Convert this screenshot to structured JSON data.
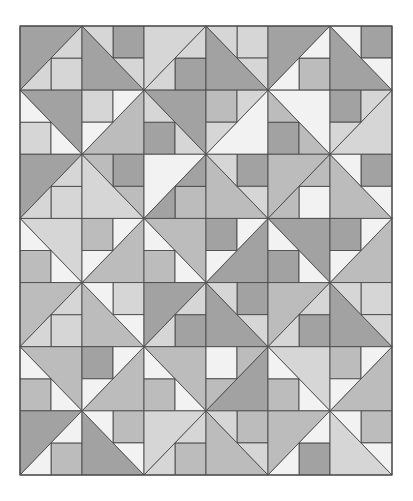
{
  "canvas": {
    "width": 413,
    "height": 501,
    "background": "#ffffff"
  },
  "grid": {
    "left": 20,
    "top": 26,
    "width": 372,
    "height": 449,
    "cols": 6,
    "rows": 7,
    "line_color": "#4a4a4a"
  },
  "palette": {
    "D": "#a2a2a2",
    "M": "#bcbcbc",
    "L": "#d6d6d6",
    "W": "#f2f2f2"
  },
  "block_types": {
    "A": "diagonal bottom-left to top-right, large triangle top-left, square bottom-right",
    "B": "diagonal top-left to bottom-right, large triangle bottom-left, square top-right",
    "C": "diagonal top-left to bottom-right, large triangle top-right, square bottom-left",
    "D": "diagonal bottom-left to top-right, large triangle bottom-right, square top-left"
  },
  "blocks": [
    [
      {
        "t": "A",
        "big": "D",
        "sq": "L",
        "tri": "L"
      },
      {
        "t": "B",
        "big": "D",
        "sq": "D",
        "tri": "L"
      },
      {
        "t": "A",
        "big": "L",
        "sq": "D",
        "tri": "L"
      },
      {
        "t": "B",
        "big": "D",
        "sq": "L",
        "tri": "L"
      },
      {
        "t": "A",
        "big": "D",
        "sq": "M",
        "tri": "W"
      },
      {
        "t": "B",
        "big": "D",
        "sq": "D",
        "tri": "W"
      }
    ],
    [
      {
        "t": "C",
        "big": "D",
        "sq": "L",
        "tri": "W"
      },
      {
        "t": "D",
        "big": "M",
        "sq": "L",
        "tri": "W"
      },
      {
        "t": "C",
        "big": "D",
        "sq": "D",
        "tri": "L"
      },
      {
        "t": "D",
        "big": "W",
        "sq": "M",
        "tri": "L"
      },
      {
        "t": "C",
        "big": "W",
        "sq": "D",
        "tri": "M"
      },
      {
        "t": "D",
        "big": "L",
        "sq": "D",
        "tri": "L"
      }
    ],
    [
      {
        "t": "A",
        "big": "D",
        "sq": "L",
        "tri": "L"
      },
      {
        "t": "B",
        "big": "L",
        "sq": "D",
        "tri": "M"
      },
      {
        "t": "A",
        "big": "W",
        "sq": "M",
        "tri": "D"
      },
      {
        "t": "B",
        "big": "M",
        "sq": "D",
        "tri": "L"
      },
      {
        "t": "A",
        "big": "M",
        "sq": "W",
        "tri": "M"
      },
      {
        "t": "B",
        "big": "M",
        "sq": "D",
        "tri": "W"
      }
    ],
    [
      {
        "t": "C",
        "big": "L",
        "sq": "M",
        "tri": "W"
      },
      {
        "t": "D",
        "big": "M",
        "sq": "M",
        "tri": "W"
      },
      {
        "t": "C",
        "big": "M",
        "sq": "M",
        "tri": "W"
      },
      {
        "t": "D",
        "big": "D",
        "sq": "D",
        "tri": "W"
      },
      {
        "t": "C",
        "big": "D",
        "sq": "D",
        "tri": "W"
      },
      {
        "t": "D",
        "big": "M",
        "sq": "D",
        "tri": "W"
      }
    ],
    [
      {
        "t": "A",
        "big": "M",
        "sq": "L",
        "tri": "L"
      },
      {
        "t": "B",
        "big": "M",
        "sq": "L",
        "tri": "W"
      },
      {
        "t": "A",
        "big": "D",
        "sq": "D",
        "tri": "L"
      },
      {
        "t": "B",
        "big": "D",
        "sq": "D",
        "tri": "L"
      },
      {
        "t": "A",
        "big": "M",
        "sq": "D",
        "tri": "L"
      },
      {
        "t": "B",
        "big": "D",
        "sq": "L",
        "tri": "L"
      }
    ],
    [
      {
        "t": "C",
        "big": "M",
        "sq": "M",
        "tri": "W"
      },
      {
        "t": "D",
        "big": "M",
        "sq": "D",
        "tri": "W"
      },
      {
        "t": "C",
        "big": "M",
        "sq": "M",
        "tri": "W"
      },
      {
        "t": "D",
        "big": "D",
        "sq": "W",
        "tri": "M"
      },
      {
        "t": "C",
        "big": "L",
        "sq": "M",
        "tri": "W"
      },
      {
        "t": "D",
        "big": "M",
        "sq": "M",
        "tri": "W"
      }
    ],
    [
      {
        "t": "A",
        "big": "D",
        "sq": "M",
        "tri": "W"
      },
      {
        "t": "B",
        "big": "D",
        "sq": "M",
        "tri": "W"
      },
      {
        "t": "A",
        "big": "L",
        "sq": "M",
        "tri": "L"
      },
      {
        "t": "B",
        "big": "M",
        "sq": "M",
        "tri": "L"
      },
      {
        "t": "A",
        "big": "M",
        "sq": "D",
        "tri": "W"
      },
      {
        "t": "B",
        "big": "L",
        "sq": "M",
        "tri": "W"
      }
    ]
  ]
}
